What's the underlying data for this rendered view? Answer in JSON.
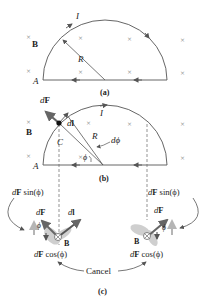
{
  "panels": {
    "a": {
      "caption": "(a)",
      "current_label": "I",
      "field_label": "B",
      "radius_label": "R",
      "point_label": "A"
    },
    "b": {
      "caption": "(b)",
      "current_label": "I",
      "field_label": "B",
      "radius_label": "R",
      "point_label": "A",
      "center_label": "C",
      "force_label_d": "d",
      "force_label_F": "F",
      "dl_label_d": "d",
      "dl_label_l": "l",
      "dphi_label": "dϕ",
      "phi_label": "ϕ"
    },
    "c": {
      "caption": "(c)",
      "left": {
        "sin_label_d": "d",
        "sin_label_F": "F",
        "sin_label_rest": " sin(ϕ)",
        "cos_label_d": "d",
        "cos_label_F": "F",
        "cos_label_rest": " cos(ϕ)",
        "force_label_d": "d",
        "force_label_F": "F",
        "dl_label_d": "d",
        "dl_label_l": "l",
        "phi_label": "ϕ",
        "field_label": "B"
      },
      "right": {
        "sin_label_d": "d",
        "sin_label_F": "F",
        "sin_label_rest": " sin(ϕ)",
        "cos_label_d": "d",
        "cos_label_F": "F",
        "cos_label_rest": " cos(ϕ)",
        "force_label_d": "d",
        "force_label_F": "F",
        "phi_label": "ϕ",
        "field_label": "B"
      },
      "cancel_label": "Cancel"
    }
  },
  "colors": {
    "wire": "#555555",
    "arrow": "#666666",
    "field_marks": "#9a9a9a",
    "shade": "#cfcfcf"
  }
}
